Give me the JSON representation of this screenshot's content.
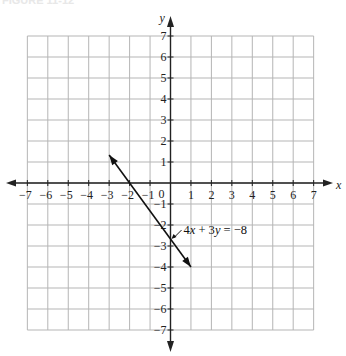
{
  "figure": {
    "label": "FIGURE 11-12"
  },
  "chart_data": {
    "type": "line",
    "title": "",
    "xlabel": "x",
    "ylabel": "y",
    "xlim": [
      -7,
      7
    ],
    "ylim": [
      -7,
      7
    ],
    "grid": true,
    "x_ticks": [
      "-7",
      "-6",
      "-5",
      "-4",
      "-3",
      "-2",
      "-1",
      "0",
      "1",
      "2",
      "3",
      "4",
      "5",
      "6",
      "7"
    ],
    "y_ticks": [
      "7",
      "6",
      "5",
      "4",
      "3",
      "2",
      "1",
      "-1",
      "-2",
      "-3",
      "-4",
      "-5",
      "-6",
      "-7"
    ],
    "series": [
      {
        "name": "4x + 3y = -8",
        "equation": "4x + 3y = -8",
        "x": [
          -3,
          -2,
          1
        ],
        "y": [
          1.33,
          0,
          -4
        ],
        "arrows": "both"
      }
    ],
    "annotations": [
      {
        "text": "4x + 3y = −8",
        "points_to": [
          0,
          -2.67
        ]
      }
    ]
  }
}
